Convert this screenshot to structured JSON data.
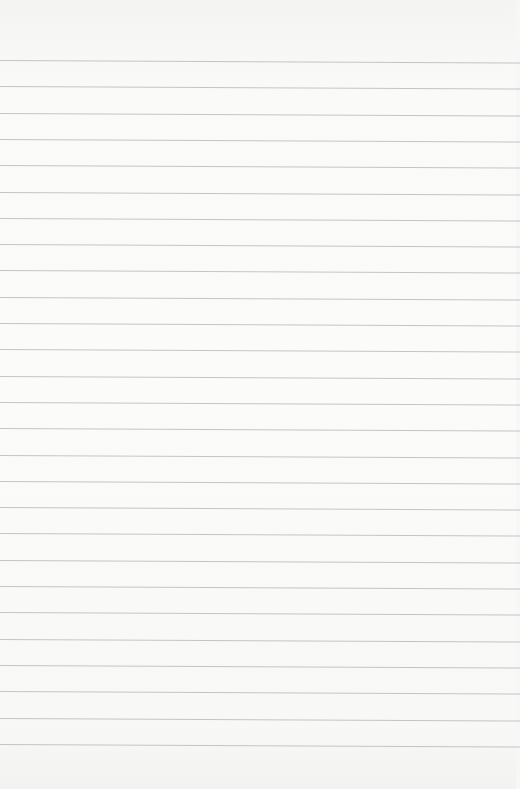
{
  "paper": {
    "background": "#fafaf9",
    "rule_color": "#b9bcc0",
    "first_rule_y": 61,
    "rule_spacing": 26.3,
    "rule_count": 27
  }
}
